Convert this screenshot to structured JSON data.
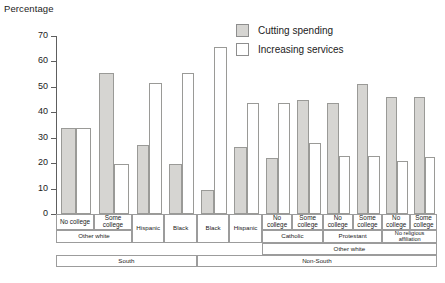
{
  "axis": {
    "y_title": "Percentage",
    "y_ticks": [
      "70",
      "60",
      "50",
      "40",
      "30",
      "20",
      "10",
      "0"
    ]
  },
  "legend": {
    "items": [
      {
        "label": "Cutting spending",
        "swatch": "filled-gray",
        "color": "#d6d5d2"
      },
      {
        "label": "Increasing services",
        "swatch": "outline-white",
        "color": "#ffffff"
      }
    ]
  },
  "group_rows": {
    "education": [
      "No college",
      "Some college",
      "No college",
      "Some college",
      "No college",
      "Some college",
      "No college",
      "Some college"
    ],
    "ethnicity": [
      "Hispanic",
      "Black",
      "Black",
      "Hispanic"
    ],
    "religion": [
      "Catholic",
      "Protestant",
      "No religious affiliation"
    ],
    "race": [
      "Other white",
      "Other white"
    ],
    "region": [
      "South",
      "Non-South"
    ]
  },
  "chart_data": {
    "type": "bar",
    "title": "",
    "xlabel": "",
    "ylabel": "Percentage",
    "ylim": [
      0,
      70
    ],
    "yticks": [
      0,
      10,
      20,
      30,
      40,
      50,
      60,
      70
    ],
    "grid": false,
    "legend_position": "top-right",
    "categories": [
      "South / Other white / No college",
      "South / Other white / Some college",
      "South / Hispanic",
      "South / Black",
      "Non-South / Black",
      "Non-South / Hispanic",
      "Non-South / Other white / Catholic / No college",
      "Non-South / Other white / Catholic / Some college",
      "Non-South / Other white / Protestant / No college",
      "Non-South / Other white / Protestant / Some college",
      "Non-South / Other white / No religious affiliation / No college",
      "Non-South / Other white / No religious affiliation / Some college"
    ],
    "series": [
      {
        "name": "Cutting spending",
        "color": "#d6d5d2",
        "values": [
          34,
          55.5,
          27,
          19.5,
          9.5,
          26.5,
          22,
          45,
          43.5,
          51,
          46,
          46
        ]
      },
      {
        "name": "Increasing services",
        "color": "#ffffff",
        "values": [
          34,
          19.5,
          51.5,
          55.5,
          65.5,
          43.5,
          43.5,
          28,
          23,
          23,
          21,
          22.5
        ]
      }
    ]
  }
}
